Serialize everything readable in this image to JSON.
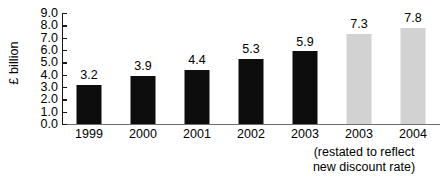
{
  "chart_data": {
    "type": "bar",
    "title": "",
    "xlabel": "",
    "ylabel": "£ billion",
    "categories": [
      "1999",
      "2000",
      "2001",
      "2002",
      "2003",
      "2003",
      "2004"
    ],
    "values": [
      3.2,
      3.9,
      4.4,
      5.3,
      5.9,
      7.3,
      7.8
    ],
    "value_labels": [
      "3.2",
      "3.9",
      "4.4",
      "5.3",
      "5.9",
      "7.3",
      "7.8"
    ],
    "series": [
      {
        "name": "£ billion",
        "values": [
          3.2,
          3.9,
          4.4,
          5.3,
          5.9,
          7.3,
          7.8
        ],
        "bar_styles": [
          "dark",
          "dark",
          "dark",
          "dark",
          "dark",
          "light",
          "light"
        ]
      }
    ],
    "ylim": [
      0.0,
      9.0
    ],
    "ytick_labels": [
      "0.0",
      "1.0",
      "2.0",
      "3.0",
      "4.0",
      "5.0",
      "6.0",
      "7.0",
      "8.0",
      "9.0"
    ],
    "ytick_values": [
      0.0,
      1.0,
      2.0,
      3.0,
      4.0,
      5.0,
      6.0,
      7.0,
      8.0,
      9.0
    ],
    "grid": false,
    "legend": "none",
    "annotations": [
      "(restated to reflect",
      "new discount rate)"
    ],
    "colors": {
      "bar_dark": "#0d0d0d",
      "bar_light": "#d2d2d2",
      "axis": "#1a1a1a",
      "baseline": "#6f6f6f",
      "text": "#000000",
      "background": "#ffffff"
    }
  }
}
